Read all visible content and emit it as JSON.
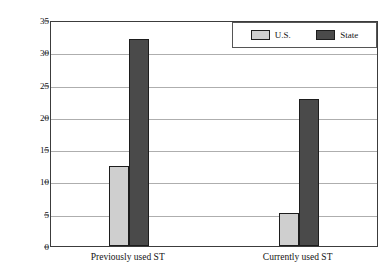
{
  "chart_data": {
    "type": "bar",
    "title": "",
    "xlabel": "",
    "ylabel": "Percent",
    "ylim": [
      0,
      35
    ],
    "yticks": [
      0,
      5,
      10,
      15,
      20,
      25,
      30,
      35
    ],
    "ytick_labels": [
      "0",
      "5",
      "10",
      "15",
      "20",
      "25",
      "30",
      "35"
    ],
    "grid": true,
    "legend_position": "top-right",
    "categories": [
      "Previously used ST",
      "Currently used ST"
    ],
    "series": [
      {
        "name": "U.S.",
        "color": "#cfcfcf",
        "values": [
          12.4,
          5.1
        ]
      },
      {
        "name": "State",
        "color": "#4a4a4a",
        "values": [
          32.0,
          22.8
        ]
      }
    ]
  },
  "legend": {
    "entries": [
      {
        "label": "U.S."
      },
      {
        "label": "State"
      }
    ]
  }
}
